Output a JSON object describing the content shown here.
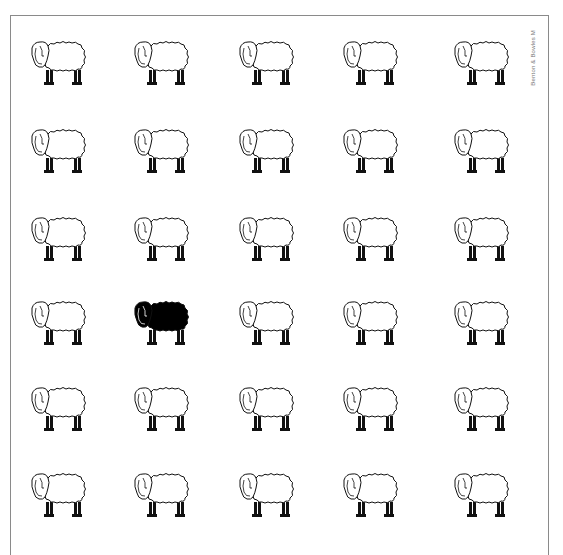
{
  "credit": "Benton & Bowles M",
  "grid": {
    "columns": 5,
    "rows": 6,
    "col_x": [
      26,
      129,
      234,
      338,
      449
    ],
    "row_y": [
      34,
      122,
      210,
      294,
      380,
      466
    ]
  },
  "colors": {
    "white_sheep_fill": "#ffffff",
    "black_sheep_fill": "#000000",
    "outline": "#111111",
    "frame": "#8a8a8a"
  },
  "sheep": [
    {
      "row": 0,
      "col": 0,
      "color": "white"
    },
    {
      "row": 0,
      "col": 1,
      "color": "white"
    },
    {
      "row": 0,
      "col": 2,
      "color": "white"
    },
    {
      "row": 0,
      "col": 3,
      "color": "white"
    },
    {
      "row": 0,
      "col": 4,
      "color": "white"
    },
    {
      "row": 1,
      "col": 0,
      "color": "white"
    },
    {
      "row": 1,
      "col": 1,
      "color": "white"
    },
    {
      "row": 1,
      "col": 2,
      "color": "white"
    },
    {
      "row": 1,
      "col": 3,
      "color": "white"
    },
    {
      "row": 1,
      "col": 4,
      "color": "white"
    },
    {
      "row": 2,
      "col": 0,
      "color": "white"
    },
    {
      "row": 2,
      "col": 1,
      "color": "white"
    },
    {
      "row": 2,
      "col": 2,
      "color": "white"
    },
    {
      "row": 2,
      "col": 3,
      "color": "white"
    },
    {
      "row": 2,
      "col": 4,
      "color": "white"
    },
    {
      "row": 3,
      "col": 0,
      "color": "white"
    },
    {
      "row": 3,
      "col": 1,
      "color": "black"
    },
    {
      "row": 3,
      "col": 2,
      "color": "white"
    },
    {
      "row": 3,
      "col": 3,
      "color": "white"
    },
    {
      "row": 3,
      "col": 4,
      "color": "white"
    },
    {
      "row": 4,
      "col": 0,
      "color": "white"
    },
    {
      "row": 4,
      "col": 1,
      "color": "white"
    },
    {
      "row": 4,
      "col": 2,
      "color": "white"
    },
    {
      "row": 4,
      "col": 3,
      "color": "white"
    },
    {
      "row": 4,
      "col": 4,
      "color": "white"
    },
    {
      "row": 5,
      "col": 0,
      "color": "white"
    },
    {
      "row": 5,
      "col": 1,
      "color": "white"
    },
    {
      "row": 5,
      "col": 2,
      "color": "white"
    },
    {
      "row": 5,
      "col": 3,
      "color": "white"
    },
    {
      "row": 5,
      "col": 4,
      "color": "white"
    }
  ]
}
